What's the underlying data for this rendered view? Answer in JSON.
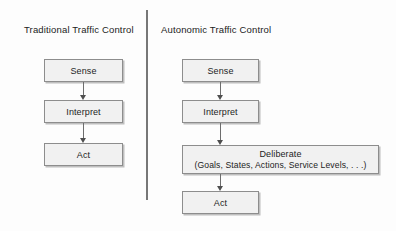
{
  "diagram": {
    "title": "",
    "background_color": "#fdfdfd",
    "box_fill_color": "#f1f1f1",
    "box_border_color": "#8d8d8d",
    "arrow_color": "#4f4f4f",
    "divider_color": "#5b5b5b"
  },
  "columns": [
    {
      "id": "traditional",
      "title": "Traditional Traffic Control",
      "nodes": [
        {
          "id": "sense",
          "line1": "Sense",
          "line2": ""
        },
        {
          "id": "interpret",
          "line1": "Interpret",
          "line2": ""
        },
        {
          "id": "act",
          "line1": "Act",
          "line2": ""
        }
      ],
      "arrows": [
        {
          "from": "sense",
          "to": "interpret"
        },
        {
          "from": "interpret",
          "to": "act"
        }
      ]
    },
    {
      "id": "autonomic",
      "title": "Autonomic Traffic Control",
      "nodes": [
        {
          "id": "sense",
          "line1": "Sense",
          "line2": ""
        },
        {
          "id": "interpret",
          "line1": "Interpret",
          "line2": ""
        },
        {
          "id": "deliberate",
          "line1": "Deliberate",
          "line2": "(Goals, States, Actions, Service Levels, . . .)"
        },
        {
          "id": "act",
          "line1": "Act",
          "line2": ""
        }
      ],
      "arrows": [
        {
          "from": "sense",
          "to": "interpret"
        },
        {
          "from": "interpret",
          "to": "deliberate"
        },
        {
          "from": "deliberate",
          "to": "act"
        }
      ]
    }
  ]
}
